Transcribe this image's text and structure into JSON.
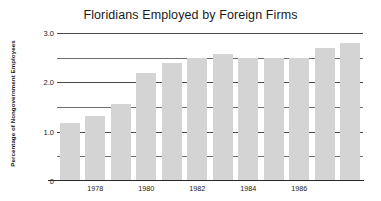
{
  "chart_data": {
    "type": "bar",
    "title": "Floridians Employed by Foreign Firms",
    "xlabel": "",
    "ylabel": "Percentage of Nongovernment Employees",
    "categories": [
      "1977",
      "1978",
      "1979",
      "1980",
      "1981",
      "1982",
      "1983",
      "1984",
      "1985",
      "1986",
      "1987",
      "1988"
    ],
    "values": [
      1.17,
      1.32,
      1.57,
      2.18,
      2.4,
      2.5,
      2.57,
      2.5,
      2.5,
      2.5,
      2.7,
      2.79
    ],
    "x_tick_labels": [
      "1978",
      "1980",
      "1982",
      "1984",
      "1986"
    ],
    "x_tick_categories": [
      "1978",
      "1980",
      "1982",
      "1984",
      "1986"
    ],
    "y_tick_labels": [
      "3.0",
      "2.0",
      "1.0",
      "0"
    ],
    "y_tick_values": [
      3.0,
      2.0,
      1.0,
      0
    ],
    "gridline_values": [
      3.0,
      2.5,
      2.0,
      1.5,
      1.0,
      0.5
    ],
    "ylim": [
      0,
      3.0
    ],
    "grid": true,
    "legend": false,
    "bar_color": "#d4d4d4",
    "gridline_color": "#4a4a4a",
    "axis_color": "#2b2b2b",
    "background_color": "#ffffff",
    "text_color": "#1a1a1a"
  }
}
